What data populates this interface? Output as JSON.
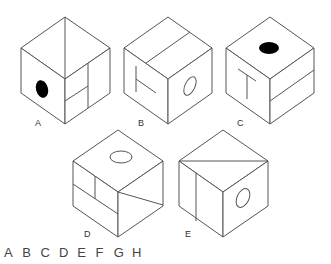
{
  "puzzle": {
    "cubes": [
      {
        "label": "A",
        "top_face": "diagonal line",
        "left_face": "black filled oval",
        "right_face": "vertical line with horizontal split"
      },
      {
        "label": "B",
        "top_face": "line parallel to edge",
        "left_face": "T rotated sideways",
        "right_face": "outlined oval"
      },
      {
        "label": "C",
        "top_face": "black filled oval",
        "left_face": "T upright",
        "right_face": "line parallel to edge"
      },
      {
        "label": "D",
        "top_face": "outlined oval",
        "left_face": "divided panels",
        "right_face": "diagonal line from center"
      },
      {
        "label": "E",
        "top_face": "diagonal line",
        "left_face": "vertical line",
        "right_face": "outlined oval"
      }
    ],
    "answer_options": [
      "A",
      "B",
      "C",
      "D",
      "E",
      "F",
      "G",
      "H"
    ]
  },
  "colors": {
    "line": "#555555",
    "fill": "#000000",
    "background": "#ffffff"
  }
}
